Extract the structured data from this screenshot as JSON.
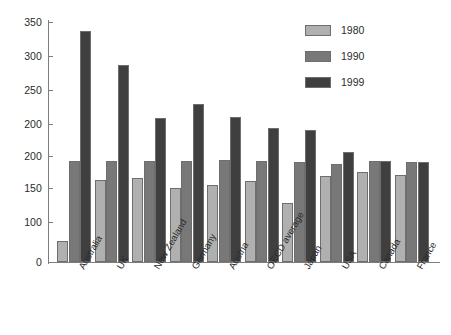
{
  "chart_data": {
    "type": "bar",
    "title": "",
    "subtitle": "",
    "xlabel": "",
    "ylabel": "",
    "categories": [
      "Australia",
      "UK",
      "New Zealand",
      "Germany",
      "Austria",
      "OECD average",
      "Japan",
      "USA",
      "Canada",
      "France"
    ],
    "series": [
      {
        "name": "1980",
        "color": "#b0b0b0",
        "values": [
          31,
          119,
          122,
          108,
          112,
          118,
          86,
          126,
          131,
          127
        ]
      },
      {
        "name": "1990",
        "color": "#787878",
        "values": [
          147,
          147,
          148,
          147,
          149,
          147,
          146,
          143,
          147,
          146
        ]
      },
      {
        "name": "1999",
        "color": "#3f3f3f",
        "values": [
          337,
          288,
          210,
          230,
          212,
          196,
          193,
          160,
          148,
          146
        ]
      }
    ],
    "ylim": [
      0,
      350
    ],
    "y_ticks": [
      {
        "value": 350,
        "label": "350"
      },
      {
        "value": 300,
        "label": "300"
      },
      {
        "value": 250,
        "label": "250"
      },
      {
        "value": 200,
        "label": "200"
      },
      {
        "value": 200,
        "label": "200"
      },
      {
        "value": 150,
        "label": "150"
      },
      {
        "value": 100,
        "label": "100"
      },
      {
        "value": 0,
        "label": "0"
      }
    ],
    "grid": false,
    "legend_position": "top-right"
  },
  "legend": {
    "entries": [
      {
        "label": "1980"
      },
      {
        "label": "1990"
      },
      {
        "label": "1999"
      }
    ]
  }
}
